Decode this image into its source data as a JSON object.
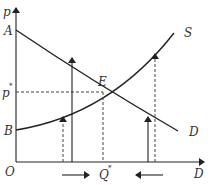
{
  "diagram": {
    "type": "supply-demand",
    "axes": {
      "y_label": "p",
      "x_label": "D",
      "origin_label": "O"
    },
    "curves": {
      "demand": {
        "label": "D",
        "start_label": "A"
      },
      "supply": {
        "label": "S",
        "start_label": "B"
      }
    },
    "equilibrium": {
      "point_label": "E",
      "price_label": "p",
      "price_sup": "*",
      "quantity_label": "Q",
      "quantity_sup": "*"
    },
    "annotations": {
      "left_arrow_direction": "right",
      "right_arrow_direction": "left"
    },
    "colors": {
      "line": "#222222",
      "dashed": "#444444",
      "text": "#333333"
    }
  }
}
